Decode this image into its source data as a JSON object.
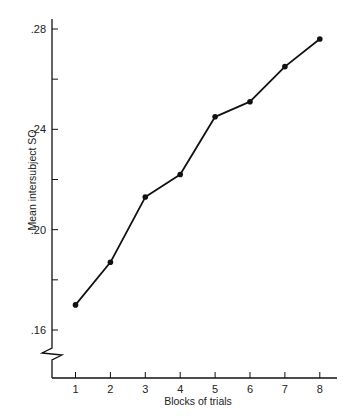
{
  "chart_data": {
    "type": "line",
    "title": "",
    "xlabel": "Blocks of trials",
    "ylabel": "Mean intersubject SO",
    "categories": [
      "1",
      "2",
      "3",
      "4",
      "5",
      "6",
      "7",
      "8"
    ],
    "x": [
      1,
      2,
      3,
      4,
      5,
      6,
      7,
      8
    ],
    "values": [
      0.17,
      0.187,
      0.213,
      0.222,
      0.245,
      0.251,
      0.265,
      0.276
    ],
    "series": [
      {
        "name": "Mean intersubject SO",
        "values": [
          0.17,
          0.187,
          0.213,
          0.222,
          0.245,
          0.251,
          0.265,
          0.276
        ]
      }
    ],
    "ylim": [
      0.16,
      0.28
    ],
    "y_ticks": [
      {
        "value": 0.28,
        "label": ".28"
      },
      {
        "value": 0.26,
        "label": ""
      },
      {
        "value": 0.24,
        "label": ".24"
      },
      {
        "value": 0.22,
        "label": ""
      },
      {
        "value": 0.2,
        "label": ".20"
      },
      {
        "value": 0.18,
        "label": ""
      },
      {
        "value": 0.16,
        "label": ".16"
      }
    ],
    "x_ticks": [
      "1",
      "2",
      "3",
      "4",
      "5",
      "6",
      "7",
      "8"
    ],
    "axis_break": true,
    "grid": false,
    "legend": "none",
    "line_color": "#111111",
    "marker": "filled-circle"
  }
}
